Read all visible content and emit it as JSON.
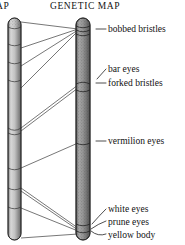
{
  "figure": {
    "title_left": "MAP",
    "title_right": "GENETIC MAP",
    "background_color": "#ffffff",
    "ink_color": "#1a1a1a"
  },
  "headers": [
    {
      "name": "cytological-map-header",
      "label": "MAP",
      "clipped": true
    },
    {
      "name": "genetic-map-header",
      "label": "GENETIC MAP",
      "clipped": false
    }
  ],
  "chromosomes": {
    "left": {
      "name": "cytological-chromosome",
      "fill_color": "#b9b9b9",
      "edge_color": "#2a2a2a",
      "x": 8,
      "top": 18,
      "bottom": 240,
      "width": 13,
      "band_rows": [
        44,
        62,
        80,
        130,
        168,
        188,
        207
      ],
      "clipped_left": true
    },
    "right": {
      "name": "genetic-chromosome",
      "fill_color": "#8f8f8f",
      "edge_color": "#262626",
      "x": 76,
      "top": 18,
      "bottom": 240,
      "width": 14,
      "band_rows": [
        31,
        87,
        144,
        224
      ],
      "stippled": true
    }
  },
  "loci": [
    {
      "id": "bobbed-bristles",
      "label": "bobbed bristles",
      "genetic_y": 29,
      "cytological_y": 22,
      "label_x": 108,
      "label_y": 24,
      "tick": {
        "x1": 95,
        "y1": 29,
        "x2": 105,
        "y2": 29
      }
    },
    {
      "id": "bar-eyes",
      "label": "bar eyes",
      "genetic_y": 82,
      "cytological_y": 48,
      "label_x": 108,
      "label_y": 67,
      "tick": {
        "x1": 98,
        "y1": 80,
        "x2": 105,
        "y2": 70
      }
    },
    {
      "id": "forked-bristles",
      "label": "forked bristles",
      "genetic_y": 88,
      "cytological_y": 66,
      "label_x": 108,
      "label_y": 80,
      "tick": {
        "x1": 95,
        "y1": 85,
        "x2": 105,
        "y2": 85
      }
    },
    {
      "id": "vermilion-eyes",
      "label": "vermilion eyes",
      "genetic_y": 143,
      "cytological_y": 128,
      "label_x": 108,
      "label_y": 137,
      "tick": {
        "x1": 95,
        "y1": 142,
        "x2": 105,
        "y2": 142
      }
    },
    {
      "id": "white-eyes",
      "label": "white eyes",
      "genetic_y": 228,
      "cytological_y": 186,
      "label_x": 108,
      "label_y": 206,
      "tick": {
        "x1": 94,
        "y1": 222,
        "x2": 105,
        "y2": 210
      }
    },
    {
      "id": "prune-eyes",
      "label": "prune eyes",
      "genetic_y": 230,
      "cytological_y": 205,
      "label_x": 108,
      "label_y": 219,
      "tick": {
        "x1": 93,
        "y1": 228,
        "x2": 105,
        "y2": 223
      }
    },
    {
      "id": "yellow-body",
      "label": "yellow body",
      "genetic_y": 233,
      "cytological_y": 238,
      "label_x": 108,
      "label_y": 232,
      "tick": {
        "x1": 93,
        "y1": 232,
        "x2": 105,
        "y2": 236
      }
    }
  ],
  "connectors": [
    {
      "id": "conn-bobbed",
      "x1": 21,
      "y1": 22,
      "x2": 76,
      "y2": 29
    },
    {
      "id": "conn-bar",
      "x1": 21,
      "y1": 48,
      "x2": 76,
      "y2": 29
    },
    {
      "id": "conn-forked",
      "x1": 21,
      "y1": 66,
      "x2": 76,
      "y2": 29
    },
    {
      "id": "conn-forked-2",
      "x1": 21,
      "y1": 88,
      "x2": 76,
      "y2": 31
    },
    {
      "id": "conn-verm-a",
      "x1": 21,
      "y1": 128,
      "x2": 76,
      "y2": 86
    },
    {
      "id": "conn-verm-b",
      "x1": 21,
      "y1": 131,
      "x2": 76,
      "y2": 89
    },
    {
      "id": "conn-white",
      "x1": 21,
      "y1": 168,
      "x2": 76,
      "y2": 143
    },
    {
      "id": "conn-prune",
      "x1": 21,
      "y1": 188,
      "x2": 76,
      "y2": 228
    },
    {
      "id": "conn-prune-2",
      "x1": 21,
      "y1": 190,
      "x2": 76,
      "y2": 230
    },
    {
      "id": "conn-yellow",
      "x1": 21,
      "y1": 207,
      "x2": 76,
      "y2": 231
    },
    {
      "id": "conn-bottom",
      "x1": 21,
      "y1": 238,
      "x2": 76,
      "y2": 234
    }
  ]
}
